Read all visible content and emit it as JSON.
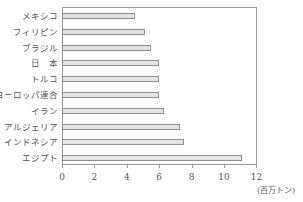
{
  "chart_data": {
    "type": "bar",
    "orientation": "horizontal",
    "title": "",
    "xlabel": "(百万トン)",
    "ylabel": "",
    "xlim": [
      0,
      12
    ],
    "x_ticks": [
      "0",
      "2",
      "4",
      "6",
      "8",
      "10",
      "12"
    ],
    "grid": false,
    "legend": null,
    "categories": [
      "メキシコ",
      "フィリピン",
      "ブラジル",
      "日　本",
      "トルコ",
      "ヨーロッパ連合",
      "イラン",
      "アルジェリア",
      "インドネシア",
      "エジプト"
    ],
    "values": [
      4.5,
      5.1,
      5.5,
      6.0,
      6.0,
      6.0,
      6.3,
      7.3,
      7.5,
      11.1
    ],
    "colors": {
      "bar_fill": "#e3e3e3",
      "bar_border": "#8f8f8f",
      "axis": "#9a9a9a",
      "text": "#555555"
    }
  }
}
